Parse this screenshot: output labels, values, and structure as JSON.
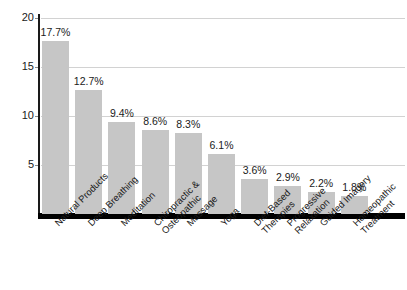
{
  "chart_data": {
    "type": "bar",
    "title": "",
    "subtitle": "",
    "xlabel": "",
    "ylabel": "",
    "ylim": [
      0,
      20
    ],
    "yticks": [
      5,
      10,
      15,
      20
    ],
    "ytick_labels": [
      "5",
      "10",
      "15",
      "20"
    ],
    "grid": true,
    "legend": "none",
    "value_suffix": "%",
    "bar_color": "#c6c6c6",
    "axis_color": "#000000",
    "grid_color": "#d2d2d2",
    "text_color": "#1a1a1a",
    "categories": [
      "Natural Products",
      "Deep Breathing",
      "Meditation",
      "Chiropractic & Osteopathic",
      "Massage",
      "Yoga",
      "Diet-Based Therapies",
      "Progressive Relaxation",
      "Guided Imagery",
      "Homeopathic Treatment"
    ],
    "category_lines": [
      [
        "Natural Products"
      ],
      [
        "Deep Breathing"
      ],
      [
        "Meditation"
      ],
      [
        "Chiropractic &",
        "Osteopathic"
      ],
      [
        "Massage"
      ],
      [
        "Yoga"
      ],
      [
        "Diet-Based",
        "Therapies"
      ],
      [
        "Progressive",
        "Relaxation"
      ],
      [
        "Guided Imagery"
      ],
      [
        "Homeopathic",
        "Treatment"
      ]
    ],
    "values": [
      17.7,
      12.7,
      9.4,
      8.6,
      8.3,
      6.1,
      3.6,
      2.9,
      2.2,
      1.8
    ],
    "value_labels": [
      "17.7%",
      "12.7%",
      "9.4%",
      "8.6%",
      "8.3%",
      "6.1%",
      "3.6%",
      "2.9%",
      "2.2%",
      "1.8%"
    ]
  }
}
